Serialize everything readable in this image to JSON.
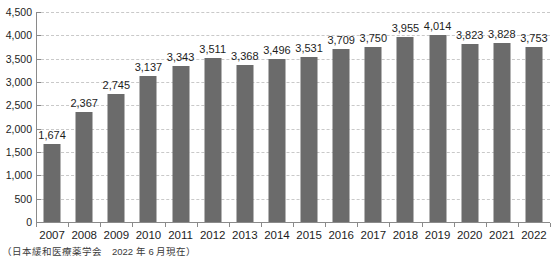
{
  "chart_data": {
    "type": "bar",
    "title": "",
    "subtitle": "",
    "xlabel": "",
    "ylabel": "",
    "categories": [
      "2007",
      "2008",
      "2009",
      "2010",
      "2011",
      "2012",
      "2013",
      "2014",
      "2015",
      "2016",
      "2017",
      "2018",
      "2019",
      "2020",
      "2021",
      "2022"
    ],
    "values": [
      1674,
      2367,
      2745,
      3137,
      3343,
      3511,
      3368,
      3496,
      3531,
      3709,
      3750,
      3955,
      4014,
      3823,
      3828,
      3753
    ],
    "value_labels": [
      "1,674",
      "2,367",
      "2,745",
      "3,137",
      "3,343",
      "3,511",
      "3,368",
      "3,496",
      "3,531",
      "3,709",
      "3,750",
      "3,955",
      "4,014",
      "3,823",
      "3,828",
      "3,753"
    ],
    "ylim": [
      0,
      4500
    ],
    "ytick_values": [
      0,
      500,
      1000,
      1500,
      2000,
      2500,
      3000,
      3500,
      4000,
      4500
    ],
    "ytick_labels": [
      "0",
      "500",
      "1,000",
      "1,500",
      "2,000",
      "2,500",
      "3,000",
      "3,500",
      "4,000",
      "4,500"
    ],
    "grid": true,
    "legend": null,
    "legend_position": "none",
    "bar_color": "#6b6b6b",
    "gridline_color": "#c9c9c9",
    "axis_color": "#8a8a8a"
  },
  "footnote": {
    "text": "（日本緩和医療薬学会　2022 年 6 月現在）"
  }
}
